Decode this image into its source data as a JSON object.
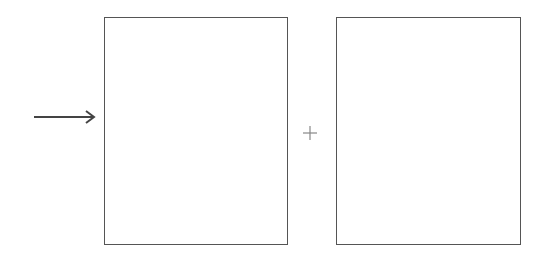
{
  "diagram": {
    "arrow": {
      "direction": "right",
      "icon": "arrow-right-icon"
    },
    "panels": [
      {
        "id": "left",
        "content": ""
      },
      {
        "id": "right",
        "content": ""
      }
    ],
    "operator": {
      "symbol": "+",
      "icon": "plus-icon"
    },
    "colors": {
      "stroke": "#555555",
      "operator": "#888888",
      "background": "#ffffff"
    }
  }
}
